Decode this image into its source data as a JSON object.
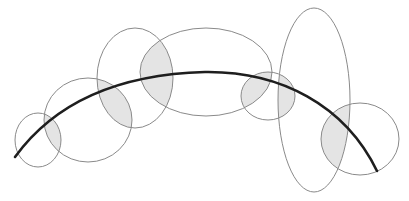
{
  "diagram": {
    "colors": {
      "background": "#ffffff",
      "ellipse_stroke": "#8a8a8a",
      "overlap_fill": "#e4e4e4",
      "curve_stroke": "#1e1e1e"
    },
    "ellipses": [
      {
        "id": "e1",
        "cx": 38,
        "cy": 140,
        "rx": 23,
        "ry": 27
      },
      {
        "id": "e2",
        "cx": 88,
        "cy": 120,
        "rx": 44,
        "ry": 42
      },
      {
        "id": "e3",
        "cx": 135,
        "cy": 78,
        "rx": 38,
        "ry": 50
      },
      {
        "id": "e4",
        "cx": 206,
        "cy": 72,
        "rx": 66,
        "ry": 44
      },
      {
        "id": "e5",
        "cx": 268,
        "cy": 96,
        "rx": 27,
        "ry": 24
      },
      {
        "id": "e6",
        "cx": 314,
        "cy": 100,
        "rx": 36,
        "ry": 92
      },
      {
        "id": "e7",
        "cx": 360,
        "cy": 139,
        "rx": 39,
        "ry": 36
      }
    ],
    "overlaps": [
      [
        "e1",
        "e2"
      ],
      [
        "e2",
        "e3"
      ],
      [
        "e3",
        "e4"
      ],
      [
        "e4",
        "e5"
      ],
      [
        "e5",
        "e6"
      ],
      [
        "e6",
        "e7"
      ]
    ],
    "curve": {
      "path": "M15,157 C60,95 130,74 205,72 C280,71 345,105 377,171"
    }
  }
}
